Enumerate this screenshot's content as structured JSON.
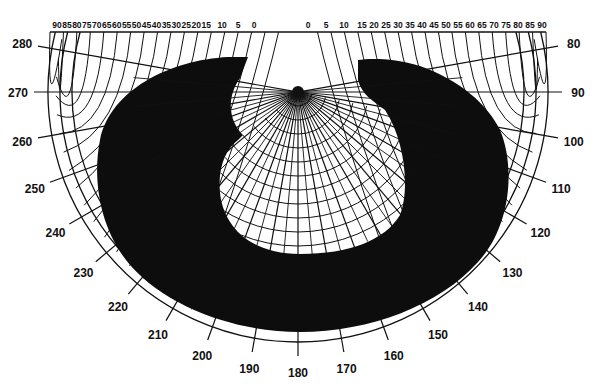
{
  "chart_data": {
    "type": "polar-shading-mask",
    "title": "",
    "center": {
      "x": 298,
      "y": 92
    },
    "outer_radius": 250,
    "top_scale_left": {
      "label_values": [
        90,
        85,
        80,
        75,
        70,
        65,
        60,
        55,
        50,
        45,
        40,
        35,
        30,
        25,
        20,
        15,
        10,
        5,
        0
      ],
      "description": "vertical shadow angle / fin angle scale (left)"
    },
    "top_scale_right": {
      "label_values": [
        0,
        5,
        10,
        15,
        20,
        25,
        30,
        35,
        40,
        45,
        50,
        55,
        60,
        65,
        70,
        75,
        80,
        85,
        90
      ],
      "description": "vertical shadow angle / fin angle scale (right)"
    },
    "azimuth_labels": [
      80,
      90,
      100,
      110,
      120,
      130,
      140,
      150,
      160,
      170,
      180,
      190,
      200,
      210,
      220,
      230,
      240,
      250,
      260,
      270,
      280
    ],
    "azimuth_range": [
      80,
      280
    ],
    "altitude_rings": 12,
    "shaded_region": {
      "color": "#0d0d0d",
      "description": "Dark horseshoe-shaped shading mask covering the outer band from approx. azimuth 90 to 270, leaving an unshaded central lens below the center and a clear outer ring band"
    },
    "line_color": "#111111",
    "background": "#ffffff"
  }
}
